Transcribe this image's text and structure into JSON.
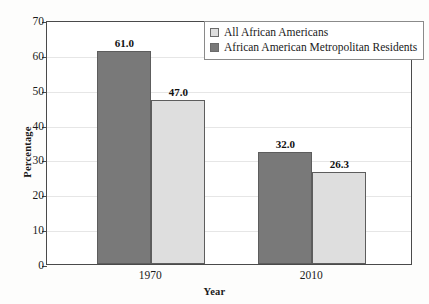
{
  "chart_data": {
    "type": "bar",
    "title": "",
    "subtitle": "",
    "xlabel": "Year",
    "ylabel": "Percentage",
    "categories": [
      "1970",
      "2010"
    ],
    "series": [
      {
        "name": "African American Metropolitan Residents",
        "color": "#797979",
        "values": [
          61.0,
          32.0
        ],
        "labels": [
          "61.0",
          "32.0"
        ]
      },
      {
        "name": "All African Americans",
        "color": "#dedede",
        "values": [
          47.0,
          26.3
        ],
        "labels": [
          "47.0",
          "26.3"
        ]
      }
    ],
    "ylim": [
      0,
      70
    ],
    "ytick_values": [
      0,
      10,
      20,
      30,
      40,
      50,
      60,
      70
    ],
    "ytick_labels": [
      "0",
      "10",
      "20",
      "30",
      "40",
      "50",
      "60",
      "70"
    ],
    "grid": true,
    "grid_axis": "y",
    "legend_position": "top-right",
    "legend_entries": [
      {
        "label": "All African Americans",
        "swatch": "light",
        "color": "#dedede"
      },
      {
        "label": "African American Metropolitan Residents",
        "swatch": "dark",
        "color": "#797979"
      }
    ],
    "frame_color": "#4a4a4a",
    "background_color": "#ffffff"
  }
}
